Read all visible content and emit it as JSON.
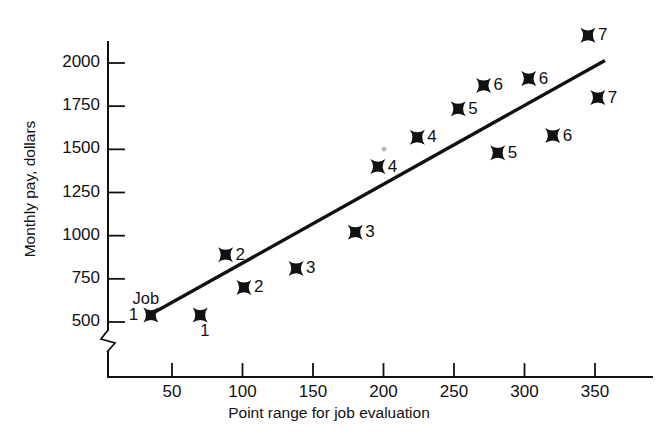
{
  "chart_data": {
    "type": "scatter",
    "title": "",
    "xlabel": "Point range for job evaluation",
    "ylabel": "Monthly pay, dollars",
    "xlim": [
      0,
      380
    ],
    "ylim": [
      430,
      2230
    ],
    "grid": false,
    "legend": "none",
    "y_axis_break": true,
    "xticks": [
      50,
      100,
      150,
      200,
      250,
      300,
      350
    ],
    "xtick_labels": [
      "50",
      "100",
      "150",
      "200",
      "250",
      "300",
      "350"
    ],
    "yticks": [
      500,
      750,
      1000,
      1250,
      1500,
      1750,
      2000
    ],
    "ytick_labels": [
      "500",
      "750",
      "1000",
      "1250",
      "1500",
      "1750",
      "2000"
    ],
    "annotations": [
      {
        "text": "Job",
        "x": 22,
        "y": 640
      },
      {
        "text": "1",
        "x": 70,
        "y": 455
      }
    ],
    "marker_style": "four-pointed-star",
    "points": [
      {
        "x": 35,
        "y": 540,
        "label": "1",
        "label_side": "left"
      },
      {
        "x": 70,
        "y": 540,
        "label": "",
        "label_side": "none"
      },
      {
        "x": 88,
        "y": 890,
        "label": "2",
        "label_side": "right"
      },
      {
        "x": 101,
        "y": 700,
        "label": "2",
        "label_side": "right"
      },
      {
        "x": 138,
        "y": 810,
        "label": "3",
        "label_side": "right"
      },
      {
        "x": 180,
        "y": 1020,
        "label": "3",
        "label_side": "right"
      },
      {
        "x": 196,
        "y": 1400,
        "label": "4",
        "label_side": "right"
      },
      {
        "x": 224,
        "y": 1570,
        "label": "4",
        "label_side": "right"
      },
      {
        "x": 253,
        "y": 1735,
        "label": "5",
        "label_side": "right"
      },
      {
        "x": 271,
        "y": 1870,
        "label": "6",
        "label_side": "right"
      },
      {
        "x": 281,
        "y": 1480,
        "label": "5",
        "label_side": "right"
      },
      {
        "x": 303,
        "y": 1910,
        "label": "6",
        "label_side": "right"
      },
      {
        "x": 320,
        "y": 1580,
        "label": "6",
        "label_side": "right"
      },
      {
        "x": 345,
        "y": 2160,
        "label": "7",
        "label_side": "right"
      },
      {
        "x": 352,
        "y": 1800,
        "label": "7",
        "label_side": "right"
      }
    ],
    "trend_line": {
      "x1": 35,
      "y1": 545,
      "x2": 356,
      "y2": 2010
    },
    "series_name": "Job evaluation points vs monthly pay"
  },
  "colors": {
    "ink": "#111111",
    "background": "#ffffff",
    "artifact_dot": "#b9b9b9"
  }
}
